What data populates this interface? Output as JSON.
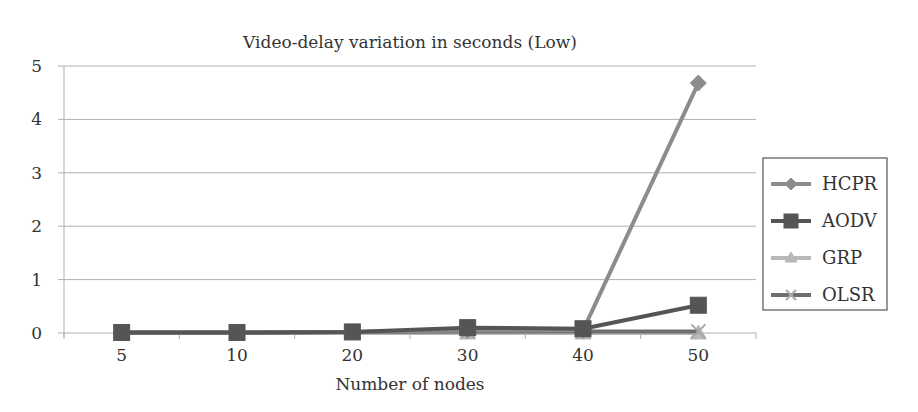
{
  "chart_data": {
    "type": "line",
    "title": "Video-delay variation in seconds (Low)",
    "xlabel": "Number of nodes",
    "ylabel": "",
    "categories": [
      "5",
      "10",
      "20",
      "30",
      "40",
      "50"
    ],
    "ylim": [
      0,
      5
    ],
    "yticks": [
      0,
      1,
      2,
      3,
      4,
      5
    ],
    "grid": true,
    "legend_position": "right",
    "series": [
      {
        "name": "HCPR",
        "values": [
          0.01,
          0.01,
          0.02,
          0.05,
          0.05,
          4.68
        ],
        "color": "#8c8c8c",
        "marker": "diamond"
      },
      {
        "name": "AODV",
        "values": [
          0.01,
          0.01,
          0.02,
          0.1,
          0.08,
          0.52
        ],
        "color": "#555555",
        "marker": "square"
      },
      {
        "name": "GRP",
        "values": [
          0.0,
          0.0,
          0.0,
          0.0,
          0.0,
          0.0
        ],
        "color": "#b8b8b8",
        "marker": "triangle"
      },
      {
        "name": "OLSR",
        "values": [
          0.01,
          0.01,
          0.02,
          0.03,
          0.03,
          0.03
        ],
        "color": "#6e6e6e",
        "marker": "x"
      }
    ]
  }
}
